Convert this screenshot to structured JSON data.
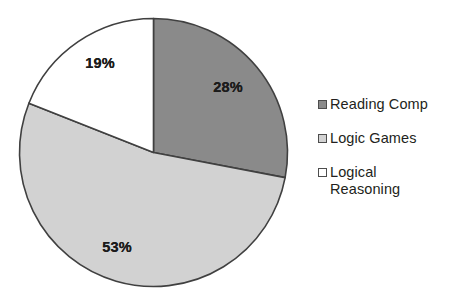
{
  "chart_data": {
    "type": "pie",
    "title": "",
    "subtitle": "",
    "xlabel": "",
    "ylabel": "",
    "categories": [
      "Reading Comp",
      "Logic Games",
      "Logical Reasoning"
    ],
    "values": [
      28,
      53,
      19
    ],
    "value_unit": "%",
    "data_labels": [
      "28%",
      "53%",
      "19%"
    ],
    "slice_colors": [
      "#8a8a8a",
      "#d2d2d2",
      "#ffffff"
    ],
    "slice_border_color": "#404040",
    "start_angle_deg": 0,
    "direction": "clockwise",
    "legend_position": "right",
    "grid": false,
    "legend": [
      {
        "label": "Reading Comp",
        "swatch_color": "#8a8a8a",
        "value": 28
      },
      {
        "label": "Logic Games",
        "swatch_color": "#d2d2d2",
        "value": 53
      },
      {
        "label": "Logical Reasoning",
        "swatch_color": "#ffffff",
        "value": 19
      }
    ]
  },
  "legend": {
    "items": [
      {
        "label": "Reading Comp"
      },
      {
        "label": "Logic Games"
      },
      {
        "label": "Logical Reasoning"
      }
    ]
  },
  "labels": {
    "slice_0": "28%",
    "slice_1": "53%",
    "slice_2": "19%"
  }
}
